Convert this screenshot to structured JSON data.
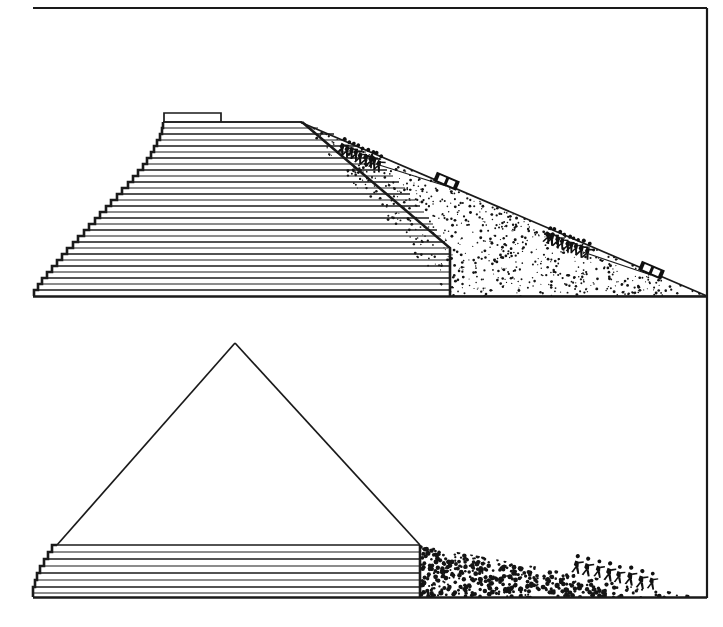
{
  "figure": {
    "medium": "black-and-white line drawing",
    "panel_count": 2,
    "frame": {
      "color": "#1a1a1a",
      "left": 33,
      "top": 8,
      "right": 707,
      "bottom": 598,
      "sides_drawn": [
        "top",
        "right"
      ]
    },
    "background_color": "#ffffff",
    "ink_color": "#1a1a1a"
  },
  "panels": [
    {
      "id": "upper-panel",
      "name": "pyramid-nearly-complete-with-full-ramp",
      "caption_text": "",
      "ground_line": {
        "y": 296,
        "x_start": 33,
        "x_end": 707
      },
      "pyramid": {
        "name": "stepped-pyramid-upper",
        "apex_type": "flat-truncated-top",
        "base_left_x": 33,
        "base_right_x": 450,
        "base_y": 296,
        "top_y": 120,
        "top_left_x": 163,
        "top_right_x": 300,
        "course_count": 28,
        "course_fill": "horizontal-line-hatching",
        "summit_block": {
          "x": 163,
          "y": 113,
          "width": 58,
          "height": 9
        }
      },
      "ramp": {
        "name": "construction-ramp-upper",
        "surface": "sand-and-rubble-stipple",
        "top_point": {
          "x": 300,
          "y": 122
        },
        "toe_point": {
          "x": 707,
          "y": 296
        },
        "vertical_face_x": 450,
        "stipple_density": "dense",
        "speck_count": 520
      },
      "hauling_teams": [
        {
          "name": "worker-team-upper",
          "worker_count": 9,
          "position": {
            "x": 340,
            "y": 150
          },
          "direction": "uphill",
          "pulls": "sledge-upper"
        },
        {
          "name": "worker-team-lower",
          "worker_count": 9,
          "position": {
            "x": 545,
            "y": 232
          },
          "direction": "uphill",
          "pulls": "sledge-lower"
        }
      ],
      "sledges": [
        {
          "name": "sledge-upper",
          "x": 446,
          "y": 181,
          "length": 22,
          "height": 9,
          "cargo": "stone-block"
        },
        {
          "name": "sledge-lower",
          "x": 651,
          "y": 270,
          "length": 22,
          "height": 9,
          "cargo": "stone-block"
        }
      ],
      "rope_lines": 2
    },
    {
      "id": "lower-panel",
      "name": "pyramid-early-stage-with-low-ramp",
      "caption_text": "",
      "ground_line": {
        "y": 598,
        "x_start": 33,
        "x_end": 707
      },
      "pyramid": {
        "name": "pyramid-outline-lower",
        "apex_type": "pointed-outline",
        "apex": {
          "x": 235,
          "y": 343
        },
        "base_left_x": 33,
        "base_right_x": 420,
        "base_y": 598,
        "course_count": 8,
        "courses_top_y": 544,
        "course_fill": "horizontal-line-hatching",
        "outline_only_above_courses": true
      },
      "ramp": {
        "name": "construction-ramp-lower",
        "surface": "coarse-rubble-stipple",
        "top_point": {
          "x": 420,
          "y": 545
        },
        "toe_point": {
          "x": 700,
          "y": 598
        },
        "stipple_density": "coarse",
        "speck_count": 330
      },
      "hauling_teams": [
        {
          "name": "worker-team-ground",
          "worker_count": 8,
          "position": {
            "x": 575,
            "y": 565
          },
          "direction": "uphill",
          "pulls": "none-visible"
        }
      ],
      "sledges": [],
      "rope_lines": 0
    }
  ],
  "legend": {
    "visible": false,
    "entries": []
  },
  "annotations": [],
  "labels": []
}
